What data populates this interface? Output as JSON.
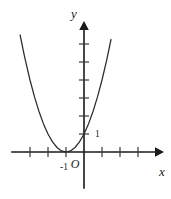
{
  "figure": {
    "kind": "cartesian-plot",
    "background_color": "#ffffff",
    "ink_color": "#1a1a1a",
    "curve_color": "#2b2b2b"
  },
  "axes": {
    "x_axis_label": "x",
    "y_axis_label": "y",
    "origin_label": "O",
    "x_arrow": "arrow-right",
    "y_arrow": "arrow-up"
  },
  "labels": {
    "x_tick_minus_one": "-1",
    "y_tick_one": "1"
  },
  "chart_data": {
    "type": "line",
    "title": "",
    "xlabel": "x",
    "ylabel": "y",
    "grid": false,
    "legend": "none",
    "axis_arrows": true,
    "equation": "y = (x + 1)^2",
    "vertex": [
      -1,
      0
    ],
    "y_intercept": 1,
    "x_intercept": -1,
    "xlim": [
      -3.6,
      3.5
    ],
    "ylim": [
      -1.2,
      7.2
    ],
    "x_ticks": [
      -3,
      -2,
      -1,
      1,
      2,
      3
    ],
    "y_ticks": [
      1,
      2,
      3,
      4,
      5,
      6
    ],
    "x_tick_labels": [
      "",
      "",
      "-1",
      "",
      "",
      ""
    ],
    "y_tick_labels": [
      "1",
      "",
      "",
      "",
      "",
      ""
    ],
    "x": [
      -3.55,
      -3.3,
      -3.0,
      -2.75,
      -2.5,
      -2.25,
      -2.0,
      -1.75,
      -1.5,
      -1.25,
      -1.0,
      -0.75,
      -0.5,
      -0.25,
      0.0,
      0.25,
      0.5,
      0.75,
      1.0,
      1.25,
      1.5
    ],
    "y": [
      6.5,
      5.29,
      4.0,
      3.06,
      2.25,
      1.5625,
      1.0,
      0.5625,
      0.25,
      0.0625,
      0.0,
      0.0625,
      0.25,
      0.5625,
      1.0,
      1.5625,
      2.25,
      3.0625,
      4.0,
      5.0625,
      6.25
    ],
    "series": [
      {
        "name": "y = (x + 1)^2",
        "values": [
          6.5,
          5.29,
          4.0,
          3.06,
          2.25,
          1.5625,
          1.0,
          0.5625,
          0.25,
          0.0625,
          0.0,
          0.0625,
          0.25,
          0.5625,
          1.0,
          1.5625,
          2.25,
          3.0625,
          4.0,
          5.0625,
          6.25
        ]
      }
    ]
  }
}
